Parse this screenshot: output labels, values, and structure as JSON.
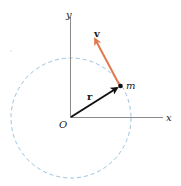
{
  "diagram": {
    "axes": {
      "x_label": "x",
      "y_label": "y",
      "origin_label": "O",
      "color": "#8a8a8a"
    },
    "circle": {
      "style": "dashed",
      "color": "#9cc3dd"
    },
    "position_vector": {
      "label": "r",
      "color": "#111111"
    },
    "velocity_vector": {
      "label": "v",
      "color": "#e07a4f"
    },
    "particle": {
      "label": "m",
      "color": "#111111"
    }
  }
}
